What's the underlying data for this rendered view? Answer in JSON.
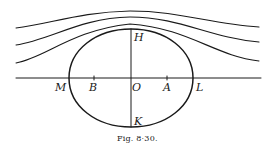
{
  "figure": {
    "caption": "Fig. 8·30.",
    "points": {
      "H": "H",
      "K": "K",
      "M": "M",
      "B": "B",
      "O": "O",
      "A": "A",
      "L": "L"
    },
    "streamline_count": 3
  }
}
